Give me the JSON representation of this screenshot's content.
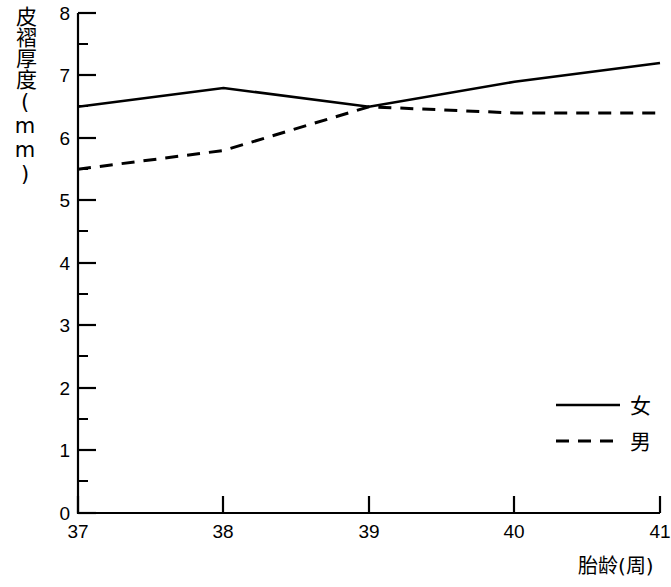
{
  "chart_data": {
    "type": "line",
    "title": "",
    "xlabel": "胎龄(周)",
    "ylabel": "皮褶厚度(mm)",
    "x": [
      37,
      38,
      39,
      40,
      41
    ],
    "xticklabels": [
      "37",
      "38",
      "39",
      "40",
      "41"
    ],
    "yticklabels": [
      "0",
      "1",
      "2",
      "3",
      "4",
      "5",
      "6",
      "7",
      "8"
    ],
    "xlim": [
      37,
      41
    ],
    "ylim": [
      0,
      8
    ],
    "grid": false,
    "legend_position": "lower-right",
    "series": [
      {
        "name": "女",
        "style": "solid",
        "color": "#000000",
        "values": [
          6.5,
          6.8,
          6.5,
          6.9,
          7.2
        ]
      },
      {
        "name": "男",
        "style": "dashed",
        "color": "#000000",
        "values": [
          5.5,
          5.8,
          6.5,
          6.4,
          6.4
        ]
      }
    ]
  },
  "legend": {
    "items": [
      {
        "label": "女",
        "style": "solid"
      },
      {
        "label": "男",
        "style": "dashed"
      }
    ]
  }
}
